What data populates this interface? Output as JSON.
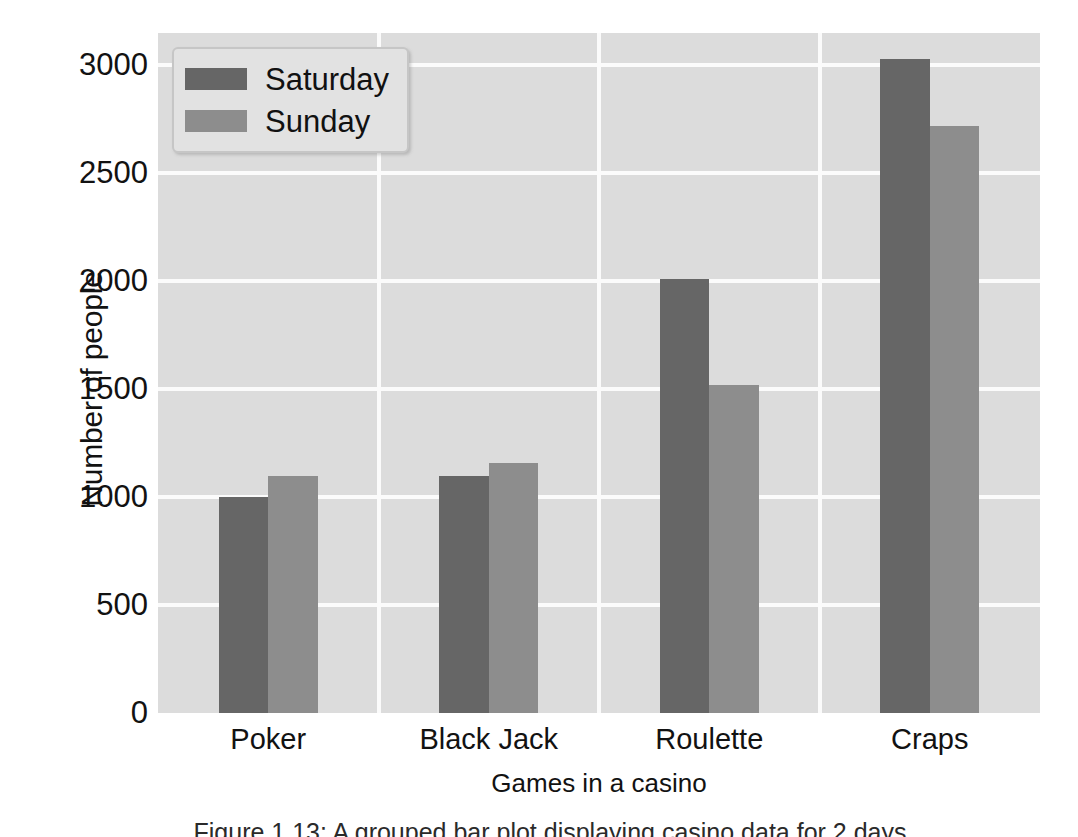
{
  "chart_data": {
    "type": "bar",
    "title": "",
    "xlabel": "Games in a casino",
    "ylabel": "Number of people",
    "categories": [
      "Poker",
      "Black Jack",
      "Roulette",
      "Craps"
    ],
    "series": [
      {
        "name": "Saturday",
        "color": "#666666",
        "values": [
          1000,
          1100,
          2010,
          3030
        ]
      },
      {
        "name": "Sunday",
        "color": "#8d8d8d",
        "values": [
          1100,
          1160,
          1520,
          2720
        ]
      }
    ],
    "ylim": [
      0,
      3150
    ],
    "yticks": [
      0,
      500,
      1000,
      1500,
      2000,
      2500,
      3000
    ],
    "ytick_labels": [
      "0",
      "500",
      "1000",
      "1500",
      "2000",
      "2500",
      "3000"
    ],
    "grid": true,
    "grid_color": "#fbfbfb",
    "plot_background": "#dcdcdc",
    "legend": {
      "position": "upper left",
      "entries": [
        {
          "label": "Saturday",
          "color": "#666666"
        },
        {
          "label": "Sunday",
          "color": "#8d8d8d"
        }
      ]
    }
  },
  "caption": {
    "text": "Figure 1.13: A grouped bar plot displaying casino data for 2 days"
  }
}
